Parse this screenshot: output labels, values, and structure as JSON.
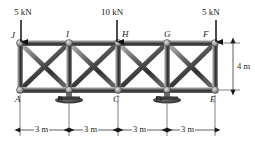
{
  "figure": {
    "type": "truss-diagram",
    "units": {
      "length": "m",
      "force": "kN"
    },
    "colors": {
      "member_dark": "#2b2b2b",
      "member_mid": "#6d6d6d",
      "member_light": "#c9c9c9",
      "gusset": "#9a9a9a",
      "support": "#4a4a4a",
      "ink": "#1a1a1a",
      "background": "#ffffff"
    }
  },
  "geometry": {
    "bay_count": 4,
    "bay_span_label": "3 m",
    "height_label": "4 m",
    "top_chord_nodes": [
      "J",
      "I",
      "H",
      "G",
      "F"
    ],
    "bottom_chord_nodes": [
      "A",
      "B",
      "C",
      "D",
      "E"
    ]
  },
  "nodes": [
    {
      "id": "J",
      "label": "J",
      "x": 20,
      "y": 43,
      "chord": "top",
      "label_dx": -9,
      "label_dy": -10
    },
    {
      "id": "I",
      "label": "I",
      "x": 69,
      "y": 43,
      "chord": "top",
      "label_dx": -3,
      "label_dy": -11
    },
    {
      "id": "H",
      "label": "H",
      "x": 118,
      "y": 43,
      "chord": "top",
      "label_dx": 4,
      "label_dy": -11
    },
    {
      "id": "G",
      "label": "G",
      "x": 167,
      "y": 43,
      "chord": "top",
      "label_dx": -3,
      "label_dy": -11
    },
    {
      "id": "F",
      "label": "F",
      "x": 215,
      "y": 43,
      "chord": "top",
      "label_dx": -12,
      "label_dy": -11
    },
    {
      "id": "A",
      "label": "A",
      "x": 20,
      "y": 90,
      "chord": "bottom",
      "label_dx": -4,
      "label_dy": 5
    },
    {
      "id": "B",
      "label": "B",
      "x": 69,
      "y": 90,
      "chord": "bottom",
      "label_dx": -11,
      "label_dy": 5
    },
    {
      "id": "C",
      "label": "C",
      "x": 118,
      "y": 90,
      "chord": "bottom",
      "label_dx": -4,
      "label_dy": 5
    },
    {
      "id": "D",
      "label": "D",
      "x": 167,
      "y": 90,
      "chord": "bottom",
      "label_dx": -11,
      "label_dy": 5
    },
    {
      "id": "E",
      "label": "E",
      "x": 215,
      "y": 90,
      "chord": "bottom",
      "label_dx": -4,
      "label_dy": 5
    }
  ],
  "members": {
    "top_chord": [
      [
        "J",
        "I"
      ],
      [
        "I",
        "H"
      ],
      [
        "H",
        "G"
      ],
      [
        "G",
        "F"
      ]
    ],
    "bottom_chord": [
      [
        "A",
        "B"
      ],
      [
        "B",
        "C"
      ],
      [
        "C",
        "D"
      ],
      [
        "D",
        "E"
      ]
    ],
    "verticals": [
      [
        "J",
        "A"
      ],
      [
        "I",
        "B"
      ],
      [
        "H",
        "C"
      ],
      [
        "G",
        "D"
      ],
      [
        "F",
        "E"
      ]
    ],
    "diagonals": [
      [
        "J",
        "B"
      ],
      [
        "A",
        "I"
      ],
      [
        "I",
        "C"
      ],
      [
        "B",
        "H"
      ],
      [
        "H",
        "D"
      ],
      [
        "C",
        "G"
      ],
      [
        "G",
        "E"
      ],
      [
        "D",
        "F"
      ]
    ]
  },
  "loads": [
    {
      "id": "load-J",
      "label": "5 kN",
      "magnitude": 5,
      "unit": "kN",
      "at_node": "J",
      "direction": "down",
      "text_x": 14,
      "text_y": 8,
      "arrow_x": 21,
      "arrow_y0": 20,
      "arrow_y1": 42
    },
    {
      "id": "load-H",
      "label": "10 kN",
      "magnitude": 10,
      "unit": "kN",
      "at_node": "H",
      "direction": "down",
      "text_x": 102,
      "text_y": 8,
      "arrow_x": 117,
      "arrow_y0": 20,
      "arrow_y1": 42
    },
    {
      "id": "load-F",
      "label": "5 kN",
      "magnitude": 5,
      "unit": "kN",
      "at_node": "F",
      "direction": "down",
      "text_x": 203,
      "text_y": 8,
      "arrow_x": 216,
      "arrow_y0": 20,
      "arrow_y1": 42
    }
  ],
  "supports": [
    {
      "id": "support-B",
      "at_node": "B",
      "type": "pin-plate",
      "x": 69,
      "y": 90
    },
    {
      "id": "support-D",
      "at_node": "D",
      "type": "pin-plate",
      "x": 167,
      "y": 90
    }
  ],
  "dimensions": {
    "horizontal": {
      "y": 130,
      "ticks": [
        20,
        69,
        118,
        167,
        215
      ],
      "segments": [
        {
          "id": "dim-span-1",
          "label": "3 m",
          "x0": 20,
          "x1": 69,
          "text_x": 37,
          "text_y": 126
        },
        {
          "id": "dim-span-2",
          "label": "3 m",
          "x0": 69,
          "x1": 118,
          "text_x": 86,
          "text_y": 126
        },
        {
          "id": "dim-span-3",
          "label": "3 m",
          "x0": 118,
          "x1": 167,
          "text_x": 135,
          "text_y": 126
        },
        {
          "id": "dim-span-4",
          "label": "3 m",
          "x0": 167,
          "x1": 215,
          "text_x": 183,
          "text_y": 126
        }
      ]
    },
    "vertical": {
      "id": "dim-height",
      "label": "4 m",
      "x": 223,
      "y0": 43,
      "y1": 90,
      "text_x": 228,
      "text_y": 62
    }
  }
}
